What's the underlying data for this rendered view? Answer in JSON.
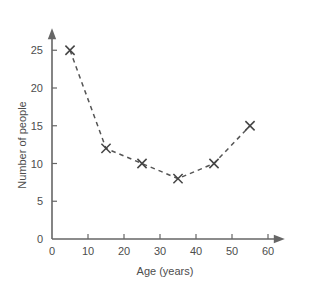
{
  "chart_data": {
    "type": "line",
    "title": "",
    "xlabel": "Age (years)",
    "ylabel": "Number of people",
    "x": [
      5,
      15,
      25,
      35,
      45,
      55
    ],
    "values": [
      25,
      12,
      10,
      8,
      10,
      15
    ],
    "series": [
      {
        "name": "Number of people",
        "x": [
          5,
          15,
          25,
          35,
          45,
          55
        ],
        "values": [
          25,
          12,
          10,
          8,
          10,
          15
        ]
      }
    ],
    "xlim": [
      0,
      63
    ],
    "ylim": [
      0,
      27
    ],
    "xticks": [
      0,
      10,
      20,
      30,
      40,
      50,
      60
    ],
    "yticks": [
      0,
      5,
      10,
      15,
      20,
      25
    ],
    "xtick_labels": [
      "0",
      "10",
      "20",
      "30",
      "40",
      "50",
      "60"
    ],
    "ytick_labels": [
      "0",
      "5",
      "10",
      "15",
      "20",
      "25"
    ],
    "grid": false,
    "legend": false,
    "marker": "x",
    "linestyle": "dashed",
    "line_color": "#555555",
    "marker_color": "#444444",
    "axis_color": "#666666",
    "background_color": "#ffffff"
  }
}
